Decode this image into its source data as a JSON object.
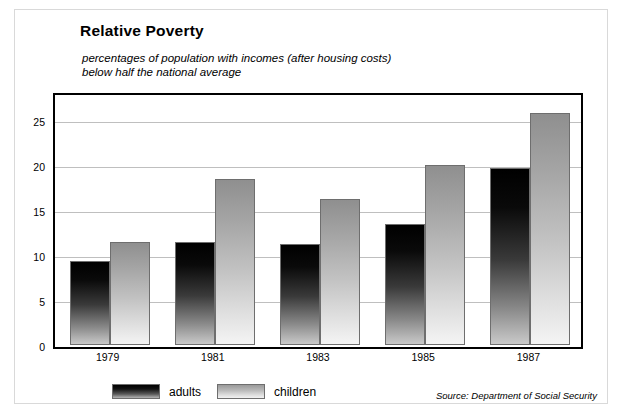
{
  "frame": {
    "border_color": "#d9d9d9",
    "plot_border_color": "#000000",
    "gridline_color": "#bfbfbf"
  },
  "header": {
    "title": "Relative Poverty",
    "subtitle": "percentages of population with incomes (after housing costs)\nbelow half the national average"
  },
  "legend": {
    "position": "bottom-left",
    "items": [
      {
        "label": "adults",
        "swatch": "dark-gradient-swatch",
        "color_top": "#000000",
        "color_bottom": "#b5b5b5"
      },
      {
        "label": "children",
        "swatch": "light-gradient-swatch",
        "color_top": "#9a9a9a",
        "color_bottom": "#f2f2f2"
      }
    ]
  },
  "source": {
    "text": "Source: Department of Social Security"
  },
  "chart_data": {
    "type": "bar",
    "title": "Relative Poverty",
    "subtitle": "percentages of population with incomes (after housing costs) below half the national average",
    "categories": [
      "1979",
      "1981",
      "1983",
      "1985",
      "1987"
    ],
    "series": [
      {
        "name": "adults",
        "values": [
          9.3,
          11.4,
          11.2,
          13.5,
          19.7
        ]
      },
      {
        "name": "children",
        "values": [
          11.5,
          18.5,
          16.2,
          20.0,
          25.8
        ]
      }
    ],
    "xlabel": "",
    "ylabel": "",
    "ylim": [
      0,
      28
    ],
    "yticks": [
      0,
      5,
      10,
      15,
      20,
      25
    ],
    "ytick_labels": [
      "0",
      "5",
      "10",
      "15",
      "20",
      "25"
    ],
    "grid": true,
    "grid_axis": "y",
    "legend": [
      "adults",
      "children"
    ],
    "source": "Source: Department of Social Security"
  }
}
